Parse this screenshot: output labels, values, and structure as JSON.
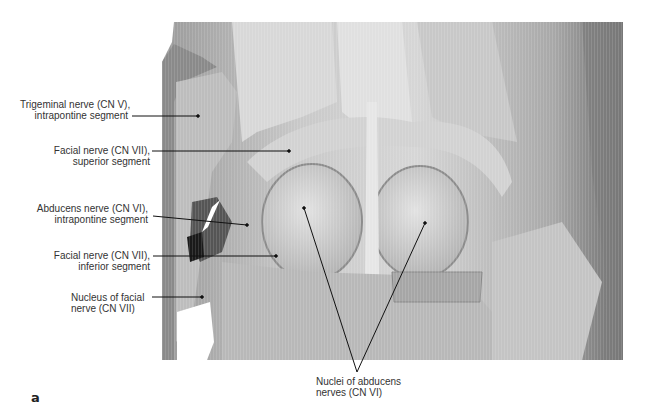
{
  "figure": {
    "panel_letter": "a",
    "image_description": "Dissected brainstem (pons, dorsal view) showing cranial nerve nuclei",
    "labels": [
      {
        "id": "trigeminal",
        "line1": "Trigeminal nerve (CN V),",
        "line2": "intrapontine segment"
      },
      {
        "id": "facial-superior",
        "line1": "Facial nerve (CN VII),",
        "line2": "superior segment"
      },
      {
        "id": "abducens",
        "line1": "Abducens nerve (CN VI),",
        "line2": "intrapontine segment"
      },
      {
        "id": "facial-inferior",
        "line1": "Facial nerve (CN VII),",
        "line2": "inferior segment"
      },
      {
        "id": "facial-nucleus",
        "line1": "Nucleus of facial",
        "line2": "nerve (CN VII)"
      },
      {
        "id": "abducens-nuclei",
        "line1": "Nuclei of abducens",
        "line2": "nerves (CN VI)"
      }
    ]
  }
}
